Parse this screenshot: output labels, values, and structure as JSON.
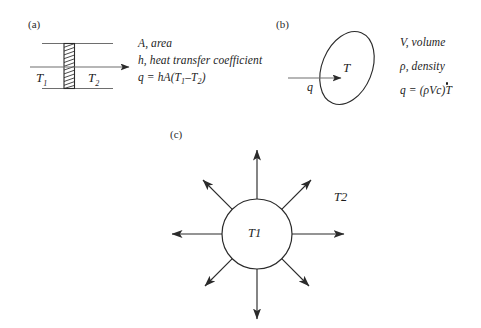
{
  "figure": {
    "caption_labels": {
      "a": "(a)",
      "b": "(b)",
      "c": "(c)"
    }
  },
  "panel_a": {
    "label": "(a)",
    "wall_label_left": "T",
    "wall_label_left_sub": "1",
    "wall_label_right": "T",
    "wall_label_right_sub": "2",
    "legend": [
      {
        "symbol": "A",
        "text": ", area"
      },
      {
        "symbol": "h",
        "text": ", heat transfer coefficient"
      }
    ],
    "equation": {
      "lhs": "q",
      "eq": " = ",
      "rhs_pre": "hA(T",
      "sub1": "1",
      "minus": "–T",
      "sub2": "2",
      "rhs_post": ")"
    },
    "geometry": {
      "wall_hatch_count": 12,
      "flow_direction": "left-to-right"
    }
  },
  "panel_b": {
    "label": "(b)",
    "blob_label": "T",
    "arrow_label": "q",
    "legend": [
      {
        "symbol": "V",
        "text": ", volume"
      },
      {
        "symbol": "ρ",
        "text": ", density"
      }
    ],
    "equation": {
      "lhs": "q",
      "eq": " = ",
      "rhs": "(ρVc)",
      "dotted_var": "T"
    }
  },
  "panel_c": {
    "label": "(c)",
    "inner_label": "T",
    "inner_label_sub": "1",
    "outer_label": "T",
    "outer_label_sub": "2",
    "arrow_count": 8
  },
  "colors": {
    "ink": "#1d1d1d",
    "stroke": "#2b2b2b",
    "background": "#ffffff"
  }
}
